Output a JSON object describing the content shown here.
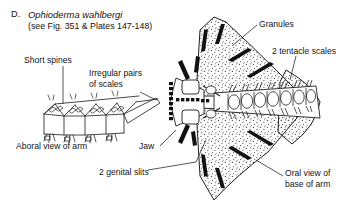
{
  "figure": {
    "letter": "D.",
    "scientific_name": "Ophioderma wahlbergi",
    "reference": "(see Fig. 351 & Plates 147-148)",
    "background_color": "#ffffff",
    "ink_color": "#141414"
  },
  "labels": {
    "short_spines": "Short spines",
    "irregular_pairs": "Irregular pairs\nof scales",
    "aboral_view": "Aboral view of arm",
    "jaw": "Jaw",
    "genital_slits": "2 genital slits",
    "granules": "Granules",
    "tentacle_scales": "2 tentacle scales",
    "oral_view": "Oral view of\nbase of arm"
  },
  "views": {
    "aboral": {
      "name": "aboral-view-of-arm",
      "description": "Line drawing of a brittle star arm seen from above showing segmented dorsal plates with irregular paired scales and short lateral spines",
      "segment_count": 4
    },
    "oral": {
      "name": "oral-view-of-base-of-arm",
      "description": "Line drawing of the oral surface at the arm base showing stippled disc, jaw with teeth papillae, genital slits, granules and tentacle scales",
      "arm_plate_count": 8
    }
  }
}
